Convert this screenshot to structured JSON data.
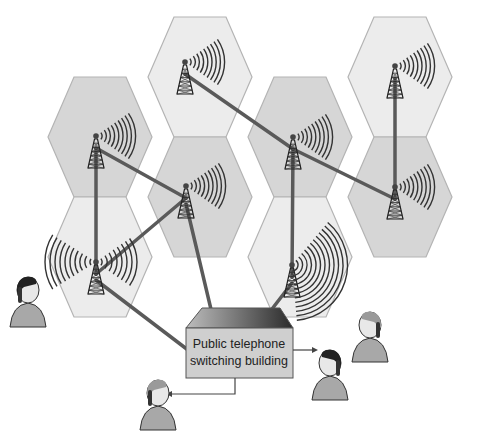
{
  "diagram": {
    "type": "cellular network",
    "building_label_line1": "Public telephone",
    "building_label_line2": "switching building",
    "colors": {
      "light_cell": "#ececec",
      "dark_cell": "#d6d6d6",
      "cell_border": "#b4b4b4",
      "link": "#5a5a5a",
      "building_front": "#cfcfcf",
      "building_roof_dark": "#2a2a2a"
    },
    "cells": [
      {
        "id": "top-center",
        "cx": 200,
        "cy": 77,
        "shade": "light"
      },
      {
        "id": "top-right",
        "cx": 400,
        "cy": 77,
        "shade": "light"
      },
      {
        "id": "mid-left",
        "cx": 100,
        "cy": 137,
        "shade": "dark"
      },
      {
        "id": "mid-right",
        "cx": 300,
        "cy": 137,
        "shade": "dark"
      },
      {
        "id": "center",
        "cx": 200,
        "cy": 197,
        "shade": "dark"
      },
      {
        "id": "right",
        "cx": 400,
        "cy": 197,
        "shade": "dark"
      },
      {
        "id": "bottom-left",
        "cx": 100,
        "cy": 257,
        "shade": "light"
      },
      {
        "id": "bottom-right",
        "cx": 300,
        "cy": 257,
        "shade": "light"
      }
    ],
    "towers": [
      {
        "id": "t-top-center",
        "x": 185,
        "y": 62
      },
      {
        "id": "t-top-right",
        "x": 395,
        "y": 66
      },
      {
        "id": "t-mid-left",
        "x": 96,
        "y": 136
      },
      {
        "id": "t-mid-right",
        "x": 293,
        "y": 137
      },
      {
        "id": "t-center",
        "x": 186,
        "y": 186
      },
      {
        "id": "t-right",
        "x": 395,
        "y": 187
      },
      {
        "id": "t-bottom-left",
        "x": 96,
        "y": 262
      },
      {
        "id": "t-bottom-right",
        "x": 292,
        "y": 265
      }
    ],
    "people": [
      "caller-left",
      "caller-right-top",
      "callee-right",
      "callee-bottom-left"
    ]
  }
}
